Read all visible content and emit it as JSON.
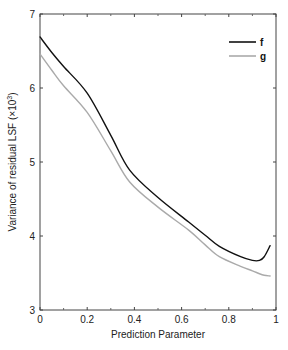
{
  "chart_data": {
    "type": "line",
    "title": "",
    "xlabel": "Prediction Parameter",
    "ylabel": "Variance of residual LSF (×10³)",
    "ylabel_main": "Variance of residual LSF (×10",
    "ylabel_sup": "3",
    "ylabel_close": ")",
    "xlim": [
      0,
      1
    ],
    "ylim": [
      3,
      7
    ],
    "xticks": [
      0,
      0.2,
      0.4,
      0.6,
      0.8,
      1
    ],
    "xtick_labels": [
      "0",
      "0.2",
      "0.4",
      "0.6",
      "0.8",
      "1"
    ],
    "yticks": [
      3,
      4,
      5,
      6,
      7
    ],
    "ytick_labels": [
      "3",
      "4",
      "5",
      "6",
      "7"
    ],
    "grid": false,
    "legend_position": "upper right",
    "series": [
      {
        "name": "f",
        "color": "#111111",
        "x": [
          0,
          0.05,
          0.1,
          0.2,
          0.3,
          0.38,
          0.5,
          0.63,
          0.7,
          0.76,
          0.85,
          0.9,
          0.93,
          0.95,
          0.975
        ],
        "values": [
          6.69,
          6.48,
          6.29,
          5.93,
          5.36,
          4.89,
          4.52,
          4.19,
          4.01,
          3.86,
          3.72,
          3.67,
          3.67,
          3.72,
          3.87
        ]
      },
      {
        "name": "g",
        "color": "#aaaaaa",
        "x": [
          0,
          0.05,
          0.1,
          0.2,
          0.3,
          0.38,
          0.5,
          0.63,
          0.7,
          0.76,
          0.85,
          0.9,
          0.93,
          0.95,
          0.975
        ],
        "values": [
          6.46,
          6.24,
          6.03,
          5.67,
          5.15,
          4.73,
          4.39,
          4.08,
          3.88,
          3.72,
          3.59,
          3.53,
          3.49,
          3.47,
          3.46
        ]
      }
    ]
  }
}
